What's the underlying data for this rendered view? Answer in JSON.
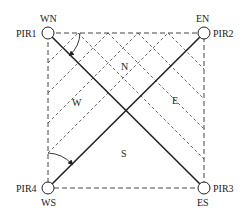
{
  "diagram": {
    "type": "sensor-layout",
    "sensors": [
      {
        "id": "PIR1",
        "label": "PIR1",
        "corner": "WN",
        "x": 48,
        "y": 33
      },
      {
        "id": "PIR2",
        "label": "PIR2",
        "corner": "EN",
        "x": 204,
        "y": 33
      },
      {
        "id": "PIR3",
        "label": "PIR3",
        "corner": "ES",
        "x": 204,
        "y": 188
      },
      {
        "id": "PIR4",
        "label": "PIR4",
        "corner": "WS",
        "x": 48,
        "y": 188
      }
    ],
    "regions": [
      {
        "label": "N",
        "x": 125,
        "y": 70
      },
      {
        "label": "W",
        "x": 76,
        "y": 106
      },
      {
        "label": "E",
        "x": 176,
        "y": 104
      },
      {
        "label": "S",
        "x": 125,
        "y": 157
      }
    ],
    "colors": {
      "line": "#222222",
      "dashed": "#444444",
      "background": "#ffffff"
    }
  }
}
